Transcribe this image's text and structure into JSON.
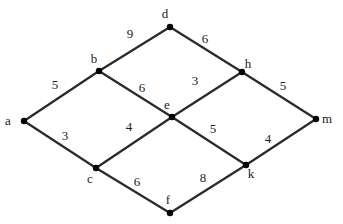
{
  "graph": {
    "nodes": [
      {
        "id": "a",
        "label": "a",
        "x": 24,
        "y": 121,
        "lx": 8,
        "ly": 125
      },
      {
        "id": "b",
        "label": "b",
        "x": 99,
        "y": 71,
        "lx": 94,
        "ly": 63
      },
      {
        "id": "c",
        "label": "c",
        "x": 96,
        "y": 168,
        "lx": 90,
        "ly": 183
      },
      {
        "id": "d",
        "label": "d",
        "x": 170,
        "y": 27,
        "lx": 165,
        "ly": 18
      },
      {
        "id": "e",
        "label": "e",
        "x": 172,
        "y": 117,
        "lx": 167,
        "ly": 109
      },
      {
        "id": "f",
        "label": "f",
        "x": 170,
        "y": 213,
        "lx": 168,
        "ly": 204
      },
      {
        "id": "h",
        "label": "h",
        "x": 242,
        "y": 72,
        "lx": 248,
        "ly": 68
      },
      {
        "id": "k",
        "label": "k",
        "x": 246,
        "y": 165,
        "lx": 251,
        "ly": 178
      },
      {
        "id": "m",
        "label": "m",
        "x": 316,
        "y": 119,
        "lx": 327,
        "ly": 123
      }
    ],
    "edges": [
      {
        "from": "a",
        "to": "b",
        "weight": "5",
        "wx": 55,
        "wy": 89
      },
      {
        "from": "a",
        "to": "c",
        "weight": "3",
        "wx": 65,
        "wy": 140
      },
      {
        "from": "b",
        "to": "d",
        "weight": "9",
        "wx": 130,
        "wy": 38
      },
      {
        "from": "b",
        "to": "e",
        "weight": "6",
        "wx": 142,
        "wy": 92
      },
      {
        "from": "c",
        "to": "e",
        "weight": "4",
        "wx": 129,
        "wy": 131
      },
      {
        "from": "c",
        "to": "f",
        "weight": "6",
        "wx": 137,
        "wy": 186
      },
      {
        "from": "d",
        "to": "h",
        "weight": "6",
        "wx": 205,
        "wy": 43
      },
      {
        "from": "e",
        "to": "h",
        "weight": "3",
        "wx": 195,
        "wy": 85
      },
      {
        "from": "e",
        "to": "k",
        "weight": "5",
        "wx": 213,
        "wy": 133
      },
      {
        "from": "f",
        "to": "k",
        "weight": "8",
        "wx": 203,
        "wy": 182
      },
      {
        "from": "h",
        "to": "m",
        "weight": "5",
        "wx": 283,
        "wy": 90
      },
      {
        "from": "k",
        "to": "m",
        "weight": "4",
        "wx": 268,
        "wy": 143
      }
    ]
  }
}
